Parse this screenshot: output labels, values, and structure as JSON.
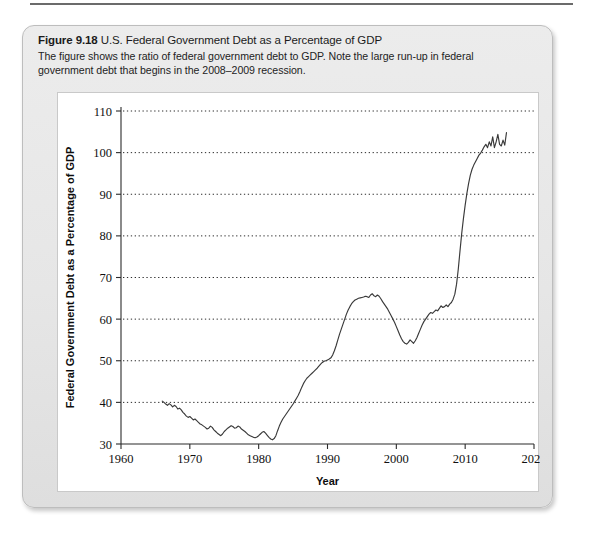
{
  "figure": {
    "number": "Figure 9.18",
    "title": "U.S. Federal Government Debt as a Percentage of GDP",
    "subtitle": "The figure shows the ratio of federal government debt to GDP. Note the large run-up in federal government debt that begins in the 2008–2009 recession."
  },
  "chart_data": {
    "type": "line",
    "title": "U.S. Federal Government Debt as a Percentage of GDP",
    "xlabel": "Year",
    "ylabel": "Federal Government Debt as a Percentage of GDP",
    "xlim": [
      1960,
      2020
    ],
    "ylim": [
      30,
      110
    ],
    "xticks": [
      1960,
      1970,
      1980,
      1990,
      2000,
      2010,
      2020
    ],
    "yticks": [
      30,
      40,
      50,
      60,
      70,
      80,
      90,
      100,
      110
    ],
    "xtick_labels": [
      "1960",
      "1970",
      "1980",
      "1990",
      "2000",
      "2010",
      "2020"
    ],
    "ytick_labels": [
      "30",
      "40",
      "50",
      "60",
      "70",
      "80",
      "90",
      "100",
      "110"
    ],
    "grid": "horizontal-dotted",
    "legend": "none",
    "series": [
      {
        "name": "Federal government debt as a percentage of GDP",
        "color": "#3a3a3a",
        "x": [
          1966.0,
          1966.25,
          1966.5,
          1966.75,
          1967.0,
          1967.25,
          1967.5,
          1967.75,
          1968.0,
          1968.25,
          1968.5,
          1968.75,
          1969.0,
          1969.25,
          1969.5,
          1969.75,
          1970.0,
          1970.25,
          1970.5,
          1970.75,
          1971.0,
          1971.25,
          1971.5,
          1971.75,
          1972.0,
          1972.25,
          1972.5,
          1972.75,
          1973.0,
          1973.25,
          1973.5,
          1973.75,
          1974.0,
          1974.25,
          1974.5,
          1974.75,
          1975.0,
          1975.25,
          1975.5,
          1975.75,
          1976.0,
          1976.25,
          1976.5,
          1976.75,
          1977.0,
          1977.25,
          1977.5,
          1977.75,
          1978.0,
          1978.25,
          1978.5,
          1978.75,
          1979.0,
          1979.25,
          1979.5,
          1979.75,
          1980.0,
          1980.25,
          1980.5,
          1980.75,
          1981.0,
          1981.25,
          1981.5,
          1981.75,
          1982.0,
          1982.25,
          1982.5,
          1982.75,
          1983.0,
          1983.25,
          1983.5,
          1983.75,
          1984.0,
          1984.25,
          1984.5,
          1984.75,
          1985.0,
          1985.25,
          1985.5,
          1985.75,
          1986.0,
          1986.25,
          1986.5,
          1986.75,
          1987.0,
          1987.25,
          1987.5,
          1987.75,
          1988.0,
          1988.25,
          1988.5,
          1988.75,
          1989.0,
          1989.25,
          1989.5,
          1989.75,
          1990.0,
          1990.25,
          1990.5,
          1990.75,
          1991.0,
          1991.25,
          1991.5,
          1991.75,
          1992.0,
          1992.25,
          1992.5,
          1992.75,
          1993.0,
          1993.25,
          1993.5,
          1993.75,
          1994.0,
          1994.25,
          1994.5,
          1994.75,
          1995.0,
          1995.25,
          1995.5,
          1995.75,
          1996.0,
          1996.25,
          1996.5,
          1996.75,
          1997.0,
          1997.25,
          1997.5,
          1997.75,
          1998.0,
          1998.25,
          1998.5,
          1998.75,
          1999.0,
          1999.25,
          1999.5,
          1999.75,
          2000.0,
          2000.25,
          2000.5,
          2000.75,
          2001.0,
          2001.25,
          2001.5,
          2001.75,
          2002.0,
          2002.25,
          2002.5,
          2002.75,
          2003.0,
          2003.25,
          2003.5,
          2003.75,
          2004.0,
          2004.25,
          2004.5,
          2004.75,
          2005.0,
          2005.25,
          2005.5,
          2005.75,
          2006.0,
          2006.25,
          2006.5,
          2006.75,
          2007.0,
          2007.25,
          2007.5,
          2007.75,
          2008.0,
          2008.25,
          2008.5,
          2008.75,
          2009.0,
          2009.25,
          2009.5,
          2009.75,
          2010.0,
          2010.25,
          2010.5,
          2010.75,
          2011.0,
          2011.25,
          2011.5,
          2011.75,
          2012.0,
          2012.25,
          2012.5,
          2012.75,
          2013.0,
          2013.25,
          2013.5,
          2013.75,
          2014.0,
          2014.25,
          2014.5,
          2014.75,
          2015.0,
          2015.25,
          2015.5,
          2015.75,
          2016.0
        ],
        "y": [
          40.3,
          40.0,
          39.6,
          39.3,
          39.7,
          39.4,
          38.9,
          39.3,
          39.0,
          38.4,
          38.6,
          38.2,
          37.6,
          37.2,
          36.7,
          36.4,
          36.6,
          36.2,
          35.8,
          36.0,
          35.6,
          35.2,
          34.8,
          34.6,
          34.3,
          34.0,
          33.6,
          33.8,
          34.3,
          34.0,
          33.4,
          33.0,
          32.6,
          32.3,
          32.0,
          32.4,
          33.0,
          33.4,
          33.8,
          34.1,
          34.4,
          34.2,
          33.8,
          33.9,
          34.3,
          34.1,
          33.6,
          33.3,
          33.0,
          32.6,
          32.2,
          32.0,
          31.8,
          31.6,
          31.5,
          31.7,
          32.0,
          32.4,
          32.8,
          33.0,
          32.6,
          32.1,
          31.6,
          31.2,
          31.0,
          31.3,
          32.0,
          33.2,
          34.3,
          35.2,
          36.0,
          36.6,
          37.2,
          37.8,
          38.4,
          39.0,
          39.6,
          40.3,
          41.0,
          41.7,
          42.6,
          43.6,
          44.5,
          45.2,
          45.8,
          46.2,
          46.6,
          47.0,
          47.4,
          47.8,
          48.2,
          48.7,
          49.2,
          49.6,
          49.9,
          50.0,
          50.2,
          50.4,
          50.7,
          51.4,
          52.4,
          53.6,
          55.0,
          56.4,
          57.6,
          58.8,
          60.0,
          61.2,
          62.2,
          63.0,
          63.7,
          64.2,
          64.6,
          64.8,
          65.0,
          65.1,
          65.2,
          65.3,
          65.5,
          65.4,
          65.2,
          65.8,
          66.1,
          65.6,
          65.4,
          65.8,
          65.5,
          64.9,
          64.2,
          63.6,
          63.0,
          62.4,
          61.6,
          60.8,
          60.0,
          59.2,
          58.2,
          57.2,
          56.2,
          55.3,
          54.6,
          54.2,
          54.0,
          54.4,
          55.0,
          54.6,
          54.2,
          54.8,
          55.6,
          56.6,
          57.6,
          58.6,
          59.4,
          60.0,
          60.6,
          61.2,
          61.6,
          61.4,
          61.8,
          62.2,
          62.0,
          62.6,
          63.2,
          62.8,
          63.0,
          63.4,
          63.0,
          63.6,
          64.0,
          64.8,
          66.0,
          68.4,
          72.0,
          76.4,
          80.6,
          84.2,
          87.4,
          90.2,
          92.6,
          94.6,
          96.0,
          97.0,
          97.8,
          98.6,
          99.4,
          99.9,
          100.6,
          101.4,
          102.0,
          101.2,
          102.6,
          101.6,
          103.8,
          101.2,
          102.6,
          104.4,
          102.0,
          101.6,
          103.0,
          101.8,
          104.8
        ]
      }
    ]
  }
}
